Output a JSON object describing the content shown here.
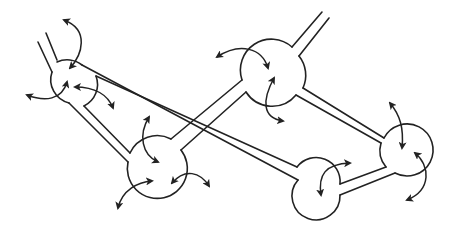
{
  "diagram": {
    "stroke_color": "#222222",
    "background": "#ffffff",
    "nodes": [
      {
        "id": "node-1",
        "cx": 75,
        "cy": 88,
        "r": 24
      },
      {
        "id": "node-2",
        "cx": 157,
        "cy": 177,
        "r": 30
      },
      {
        "id": "node-3",
        "cx": 272,
        "cy": 75,
        "r": 31
      },
      {
        "id": "node-4",
        "cx": 318,
        "cy": 188,
        "r": 24
      },
      {
        "id": "node-5",
        "cx": 407,
        "cy": 150,
        "r": 26
      }
    ],
    "connections": [
      {
        "from": "node-1",
        "to": "open-end-top-left"
      },
      {
        "from": "node-1",
        "to": "node-2"
      },
      {
        "from": "node-1",
        "to": "node-4"
      },
      {
        "from": "node-2",
        "to": "node-3"
      },
      {
        "from": "node-3",
        "to": "open-end-top-right"
      },
      {
        "from": "node-3",
        "to": "node-5"
      },
      {
        "from": "node-4",
        "to": "node-5"
      }
    ]
  }
}
